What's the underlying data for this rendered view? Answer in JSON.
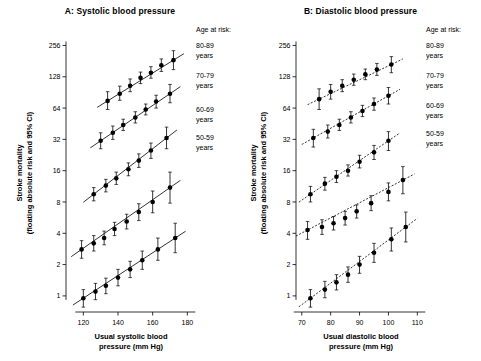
{
  "figure": {
    "panels": [
      {
        "id": "A",
        "title": "A: Systolic blood pressure",
        "age_header": "Age at risk:"
      },
      {
        "id": "B",
        "title": "B: Diastolic blood pressure",
        "age_header": "Age at risk:"
      }
    ],
    "shared_ylabel_line1": "Stroke mortality",
    "shared_ylabel_line2": "(floating absolute risk and 95% CI)"
  },
  "chart_data": [
    {
      "type": "scatter",
      "title": "A: Systolic blood pressure",
      "xlabel": "Usual systolic blood pressure (mm Hg)",
      "ylabel": "Stroke mortality (floating absolute risk and 95% CI)",
      "yscale": "log",
      "ylim": [
        0.7,
        330
      ],
      "xlim": [
        110,
        185
      ],
      "yticks": [
        1,
        2,
        4,
        8,
        16,
        32,
        64,
        128,
        256
      ],
      "ytick_labels": [
        "1",
        "2",
        "4",
        "8",
        "16",
        "32",
        "64",
        "128",
        "256"
      ],
      "xticks": [
        120,
        140,
        160,
        180
      ],
      "xtick_labels": [
        "120",
        "140",
        "160",
        "180"
      ],
      "grid": false,
      "legend_position": "right",
      "series": [
        {
          "name": "80-89 years",
          "label_lines": [
            "80-89",
            "years"
          ],
          "x": [
            134,
            141,
            147,
            153,
            159,
            165,
            172
          ],
          "y": [
            75,
            88,
            105,
            125,
            140,
            165,
            185
          ],
          "ci_low": [
            62,
            76,
            92,
            110,
            124,
            144,
            150
          ],
          "ci_high": [
            92,
            104,
            122,
            142,
            160,
            190,
            228
          ]
        },
        {
          "name": "70-79 years",
          "label_lines": [
            "70-79",
            "years"
          ],
          "x": [
            130,
            137,
            143,
            150,
            156,
            162,
            170
          ],
          "y": [
            31,
            37,
            44,
            52,
            62,
            74,
            88
          ],
          "ci_low": [
            26,
            32,
            39,
            46,
            55,
            64,
            72
          ],
          "ci_high": [
            37,
            43,
            50,
            59,
            70,
            85,
            108
          ]
        },
        {
          "name": "60-69 years",
          "label_lines": [
            "60-69",
            "years"
          ],
          "x": [
            126,
            133,
            139,
            146,
            152,
            159,
            168
          ],
          "y": [
            9.5,
            11.5,
            13.5,
            16.5,
            20,
            25,
            33
          ],
          "ci_low": [
            8.2,
            10.0,
            11.8,
            14.3,
            17.2,
            21.0,
            26.0
          ],
          "ci_high": [
            11.0,
            13.2,
            15.5,
            19.0,
            23.2,
            29.5,
            42.0
          ]
        },
        {
          "name": "50-59 years",
          "label_lines": [
            "50-59",
            "years"
          ],
          "x": [
            119,
            126,
            132,
            138,
            145,
            152,
            160,
            170
          ],
          "y": [
            2.8,
            3.2,
            3.6,
            4.4,
            5.2,
            6.4,
            8.0,
            11.0
          ],
          "ci_low": [
            2.3,
            2.7,
            3.1,
            3.8,
            4.4,
            5.3,
            6.3,
            7.8
          ],
          "ci_high": [
            3.4,
            3.8,
            4.2,
            5.1,
            6.1,
            7.7,
            10.2,
            15.5
          ]
        },
        {
          "name": "youngest (unlabelled lowest band)",
          "label_lines": [],
          "x": [
            120,
            127,
            133,
            140,
            147,
            154,
            163,
            173
          ],
          "y": [
            0.95,
            1.1,
            1.25,
            1.5,
            1.8,
            2.2,
            2.8,
            3.6
          ],
          "ci_low": [
            0.78,
            0.92,
            1.05,
            1.25,
            1.5,
            1.8,
            2.2,
            2.6
          ],
          "ci_high": [
            1.15,
            1.32,
            1.48,
            1.8,
            2.15,
            2.7,
            3.6,
            5.0
          ]
        }
      ]
    },
    {
      "type": "scatter",
      "title": "B: Diastolic blood pressure",
      "xlabel": "Usual diastolic blood pressure (mm Hg)",
      "ylabel": "Stroke mortality (floating absolute risk and 95% CI)",
      "yscale": "log",
      "ylim": [
        0.7,
        330
      ],
      "xlim": [
        68,
        113
      ],
      "yticks": [
        1,
        2,
        4,
        8,
        16,
        32,
        64,
        128,
        256
      ],
      "ytick_labels": [
        "1",
        "2",
        "4",
        "8",
        "16",
        "32",
        "64",
        "128",
        "256"
      ],
      "xticks": [
        70,
        80,
        90,
        100,
        110
      ],
      "xtick_labels": [
        "70",
        "80",
        "90",
        "100",
        "110"
      ],
      "grid": false,
      "legend_position": "right",
      "series": [
        {
          "name": "80-89 years",
          "label_lines": [
            "80-89",
            "years"
          ],
          "x": [
            76,
            80,
            84,
            88,
            92,
            96,
            101
          ],
          "y": [
            78,
            92,
            105,
            120,
            135,
            150,
            168
          ],
          "ci_low": [
            62,
            78,
            92,
            106,
            120,
            132,
            140
          ],
          "ci_high": [
            98,
            108,
            120,
            136,
            152,
            172,
            200
          ]
        },
        {
          "name": "70-79 years",
          "label_lines": [
            "70-79",
            "years"
          ],
          "x": [
            74,
            79,
            83,
            87,
            91,
            95,
            100
          ],
          "y": [
            33,
            38,
            44,
            52,
            60,
            70,
            84
          ],
          "ci_low": [
            27,
            33,
            39,
            46,
            53,
            61,
            70
          ],
          "ci_high": [
            40,
            44,
            50,
            59,
            68,
            80,
            101
          ]
        },
        {
          "name": "60-69 years",
          "label_lines": [
            "60-69",
            "years"
          ],
          "x": [
            73,
            78,
            82,
            86,
            90,
            95,
            100
          ],
          "y": [
            9.5,
            12.0,
            14.0,
            16.0,
            19.5,
            24.0,
            31.0
          ],
          "ci_low": [
            8.0,
            10.4,
            12.3,
            14.2,
            17.0,
            20.5,
            25.0
          ],
          "ci_high": [
            11.3,
            13.8,
            16.0,
            18.2,
            22.5,
            28.0,
            38.0
          ]
        },
        {
          "name": "50-59 years",
          "label_lines": [
            "50-59",
            "years"
          ],
          "x": [
            72,
            77,
            81,
            85,
            89,
            94,
            100,
            105
          ],
          "y": [
            4.3,
            4.6,
            5.0,
            5.6,
            6.5,
            7.8,
            10.0,
            13.0
          ],
          "ci_low": [
            3.5,
            3.9,
            4.3,
            4.8,
            5.6,
            6.6,
            8.2,
            9.6
          ],
          "ci_high": [
            5.2,
            5.4,
            5.8,
            6.5,
            7.5,
            9.2,
            12.2,
            17.5
          ]
        },
        {
          "name": "youngest (unlabelled lowest band)",
          "label_lines": [],
          "x": [
            73,
            78,
            82,
            86,
            90,
            95,
            101,
            106
          ],
          "y": [
            0.95,
            1.15,
            1.35,
            1.6,
            2.0,
            2.6,
            3.5,
            4.6
          ],
          "ci_low": [
            0.78,
            0.96,
            1.14,
            1.35,
            1.65,
            2.1,
            2.7,
            3.3
          ],
          "ci_high": [
            1.15,
            1.38,
            1.6,
            1.9,
            2.4,
            3.2,
            4.5,
            6.4
          ]
        }
      ]
    }
  ]
}
